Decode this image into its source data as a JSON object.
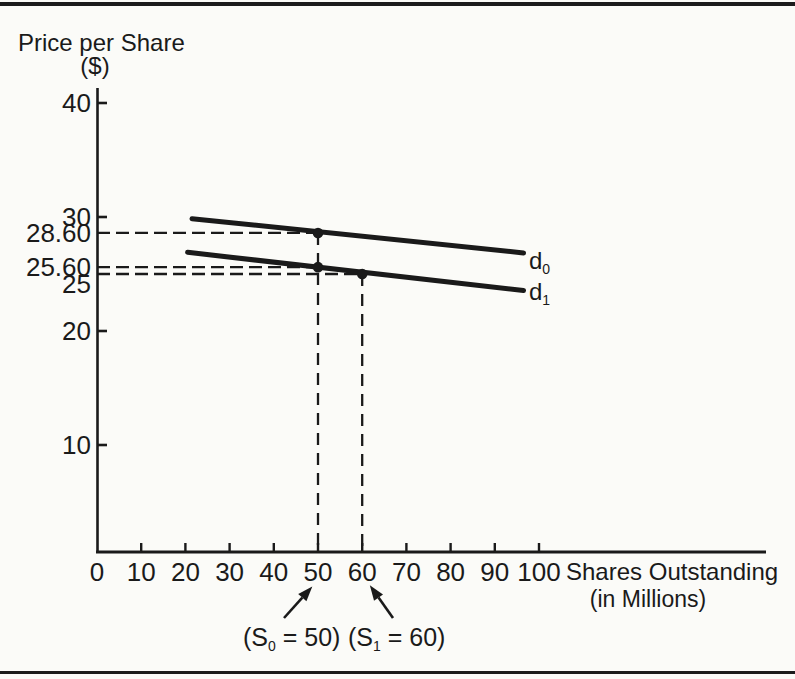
{
  "colors": {
    "ink": "#1a1a1a",
    "background": "#fbfbf8"
  },
  "chart_data": {
    "type": "line",
    "title": "",
    "ylabel": "Price per Share",
    "ylabel_units": "($)",
    "xlabel": "Shares Outstanding",
    "xlabel_units": "(in Millions)",
    "xlim": [
      0,
      151
    ],
    "ylim": [
      0,
      41
    ],
    "grid": false,
    "x_ticks": [
      0,
      10,
      20,
      30,
      40,
      50,
      60,
      70,
      80,
      90,
      100
    ],
    "y_ticks": [
      40,
      30,
      20,
      10
    ],
    "y_guide_labels": [
      {
        "value": 28.6,
        "label": "28.60",
        "dy": 0
      },
      {
        "value": 25.6,
        "label": "25.60",
        "dy": 0
      },
      {
        "value": 25.0,
        "label": "25",
        "dy": 10
      }
    ],
    "series": [
      {
        "name": "d0",
        "label_main": "d",
        "label_sub": "0",
        "points": [
          [
            21.5,
            29.85
          ],
          [
            96.5,
            26.85
          ]
        ]
      },
      {
        "name": "d1",
        "label_main": "d",
        "label_sub": "1",
        "points": [
          [
            20.5,
            26.9
          ],
          [
            96.5,
            23.55
          ]
        ]
      }
    ],
    "markers": [
      {
        "x": 50,
        "y": 28.6
      },
      {
        "x": 50,
        "y": 25.6
      },
      {
        "x": 60,
        "y": 25.0
      }
    ],
    "guides_horizontal": [
      {
        "y": 28.6,
        "x0": 0,
        "x1": 50
      },
      {
        "y": 25.6,
        "x0": 0,
        "x1": 50
      },
      {
        "y": 25.0,
        "x0": 0,
        "x1": 60
      }
    ],
    "guides_vertical": [
      {
        "x": 50,
        "y_top": 28.6
      },
      {
        "x": 60,
        "y_top": 25.0
      }
    ],
    "annotations": [
      {
        "pre": "(S",
        "sub": "0",
        "post": " = 50)",
        "arrow_from": [
          284,
          618
        ],
        "arrow_to": [
          311,
          588
        ]
      },
      {
        "pre": "(S",
        "sub": "1",
        "post": " = 60)",
        "arrow_from": [
          393,
          618
        ],
        "arrow_to": [
          371,
          587
        ]
      }
    ]
  }
}
